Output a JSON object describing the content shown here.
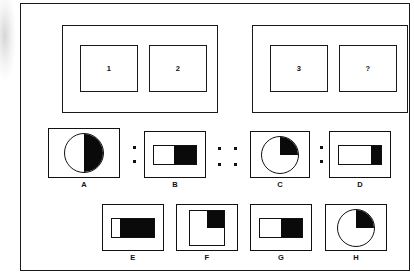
{
  "puzzle": {
    "type": "visual-analogy",
    "premise": {
      "left_panel": {
        "cells": [
          {
            "label": "1"
          },
          {
            "label": "2"
          }
        ]
      },
      "right_panel": {
        "cells": [
          {
            "label": "3"
          },
          {
            "label": "?"
          }
        ]
      }
    },
    "separators": {
      "colon_ab": ":",
      "proportion": "::",
      "colon_cd": ":"
    },
    "analogy_row": [
      {
        "label": "A",
        "shape": "circle",
        "fill": "right-half",
        "fill_fraction": 0.5
      },
      {
        "label": "B",
        "shape": "rectangle",
        "fill": "right-portion",
        "fill_fraction": 0.47
      },
      {
        "label": "C",
        "shape": "circle",
        "fill": "upper-right-quadrant",
        "fill_fraction": 0.25
      },
      {
        "label": "D",
        "shape": "rectangle",
        "fill": "right-portion",
        "fill_fraction": 0.22
      }
    ],
    "option_row": [
      {
        "label": "E",
        "shape": "rectangle",
        "fill": "right-portion",
        "fill_fraction": 0.8
      },
      {
        "label": "F",
        "shape": "square",
        "fill": "upper-right-quadrant",
        "fill_fraction": 0.25
      },
      {
        "label": "G",
        "shape": "rectangle",
        "fill": "right-portion",
        "fill_fraction": 0.5
      },
      {
        "label": "H",
        "shape": "circle",
        "fill": "upper-right-quadrant",
        "fill_fraction": 0.25
      }
    ],
    "colors": {
      "ink": "#111111",
      "fill": "#0a0a0a",
      "paper": "#ffffff"
    }
  }
}
